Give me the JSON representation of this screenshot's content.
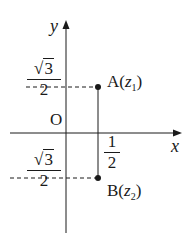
{
  "diagram": {
    "type": "complex-plane",
    "axes": {
      "x_label": "x",
      "y_label": "y",
      "origin_label": "O"
    },
    "points": [
      {
        "name": "A",
        "complex": "z",
        "subscript": "1",
        "label": "A(z₁)",
        "coords": [
          "1/2",
          "√3/2"
        ]
      },
      {
        "name": "B",
        "complex": "z",
        "subscript": "2",
        "label": "B(z₂)",
        "coords": [
          "1/2",
          "-√3/2"
        ]
      }
    ],
    "ticks": {
      "x_tick": {
        "numerator": "1",
        "denominator": "2"
      },
      "y_tick_pos": {
        "sign": "",
        "radicand": "3",
        "denominator": "2"
      },
      "y_tick_neg": {
        "sign": "−",
        "radicand": "3",
        "denominator": "2"
      }
    },
    "colors": {
      "line": "#1a1a1a",
      "background": "#ffffff"
    }
  }
}
